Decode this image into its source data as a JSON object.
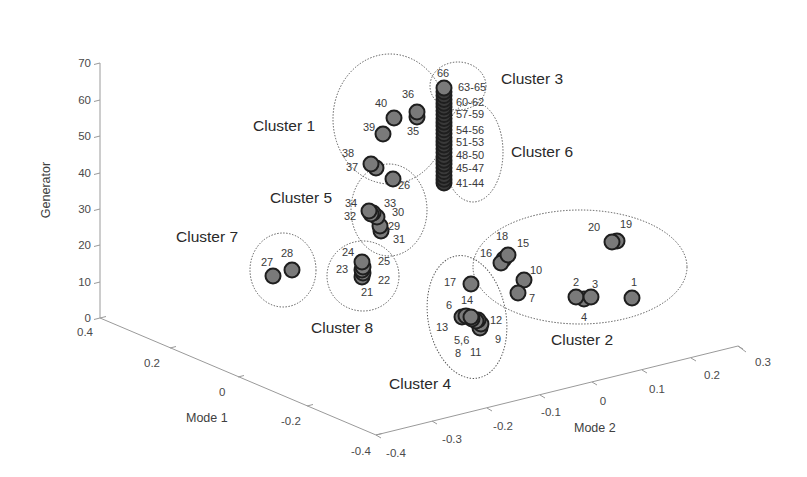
{
  "chart_data": {
    "type": "scatter",
    "subtype": "3d-scatter",
    "title": "",
    "xlabel": "Mode 1",
    "ylabel": "Mode 2",
    "zlabel": "Generator",
    "xlim": [
      -0.4,
      0.4
    ],
    "ylim": [
      -0.4,
      0.3
    ],
    "zlim": [
      0,
      70
    ],
    "x_ticks": [
      "0.4",
      "0.2",
      "0",
      "-0.2",
      "-0.4"
    ],
    "y_ticks": [
      "-0.4",
      "-0.3",
      "-0.2",
      "-0.1",
      "0",
      "0.1",
      "0.2",
      "0.3"
    ],
    "z_ticks": [
      "0",
      "10",
      "20",
      "30",
      "40",
      "50",
      "60",
      "70"
    ],
    "grid": false,
    "legend": null,
    "marker_color": "#7a7a7a",
    "marker_edge": "#1e1e1e",
    "clusters": [
      {
        "name": "Cluster 1",
        "generators": [
          35,
          36,
          37,
          38,
          39,
          40
        ]
      },
      {
        "name": "Cluster 2",
        "generators": [
          1,
          2,
          3,
          4,
          7,
          10,
          15,
          16,
          18,
          19,
          20
        ]
      },
      {
        "name": "Cluster 3",
        "generators": [
          63,
          64,
          65,
          66
        ]
      },
      {
        "name": "Cluster 4",
        "generators": [
          5,
          6,
          8,
          9,
          11,
          12,
          13,
          14,
          17
        ]
      },
      {
        "name": "Cluster 5",
        "generators": [
          26,
          29,
          30,
          31,
          32,
          33,
          34
        ]
      },
      {
        "name": "Cluster 6",
        "generators": [
          41,
          42,
          43,
          44,
          45,
          46,
          47,
          48,
          49,
          50,
          51,
          52,
          53,
          54,
          55,
          56,
          57,
          58,
          59,
          60,
          61,
          62
        ]
      },
      {
        "name": "Cluster 7",
        "generators": [
          27,
          28
        ]
      },
      {
        "name": "Cluster 8",
        "generators": [
          21,
          22,
          23,
          24,
          25
        ]
      }
    ],
    "point_labels": [
      "1",
      "2",
      "3",
      "4",
      "5,6",
      "6",
      "7",
      "8",
      "9",
      "10",
      "11",
      "12",
      "13",
      "14",
      "15",
      "16",
      "17",
      "18",
      "19",
      "20",
      "21",
      "22",
      "23",
      "24",
      "25",
      "26",
      "27",
      "28",
      "29",
      "30",
      "31",
      "32",
      "33",
      "34",
      "35",
      "36",
      "37",
      "38",
      "39",
      "40",
      "41-44",
      "45-47",
      "48-50",
      "51-53",
      "54-56",
      "57-59",
      "60-62",
      "63-65",
      "66"
    ]
  },
  "axes": {
    "z": {
      "label": "Generator",
      "ticks": [
        {
          "label": "70",
          "x": 100,
          "y": 63
        },
        {
          "label": "60",
          "x": 100,
          "y": 100
        },
        {
          "label": "50",
          "x": 100,
          "y": 136
        },
        {
          "label": "40",
          "x": 100,
          "y": 173
        },
        {
          "label": "30",
          "x": 100,
          "y": 209
        },
        {
          "label": "20",
          "x": 100,
          "y": 245
        },
        {
          "label": "10",
          "x": 100,
          "y": 282
        },
        {
          "label": "0",
          "x": 100,
          "y": 318
        }
      ]
    },
    "mode1": {
      "label": "Mode 1",
      "ticks": [
        {
          "label": "0.4",
          "x": 100,
          "y": 318,
          "lx": 77,
          "ly": 336
        },
        {
          "label": "0.2",
          "x": 170,
          "y": 348,
          "lx": 144,
          "ly": 367
        },
        {
          "label": "0",
          "x": 238,
          "y": 377,
          "lx": 219,
          "ly": 396
        },
        {
          "label": "-0.2",
          "x": 307,
          "y": 406,
          "lx": 281,
          "ly": 425
        },
        {
          "label": "-0.4",
          "x": 376,
          "y": 435,
          "lx": 351,
          "ly": 455
        }
      ]
    },
    "mode2": {
      "label": "Mode 2",
      "ticks": [
        {
          "label": "-0.4",
          "x": 376,
          "y": 435,
          "lx": 396,
          "ly": 457
        },
        {
          "label": "-0.3",
          "x": 432,
          "y": 421,
          "lx": 452,
          "ly": 443
        },
        {
          "label": "-0.2",
          "x": 487,
          "y": 408,
          "lx": 503,
          "ly": 430
        },
        {
          "label": "-0.1",
          "x": 540,
          "y": 395,
          "lx": 551,
          "ly": 416
        },
        {
          "label": "0",
          "x": 592,
          "y": 382,
          "lx": 603,
          "ly": 405
        },
        {
          "label": "0.1",
          "x": 642,
          "y": 370,
          "lx": 657,
          "ly": 393
        },
        {
          "label": "0.2",
          "x": 691,
          "y": 358,
          "lx": 712,
          "ly": 379
        },
        {
          "label": "0.3",
          "x": 738,
          "y": 346,
          "lx": 763,
          "ly": 366
        }
      ]
    }
  },
  "points": [
    {
      "id": "1",
      "x": 632,
      "y": 298
    },
    {
      "id": "4",
      "x": 584,
      "y": 299
    },
    {
      "id": "2",
      "x": 576,
      "y": 297
    },
    {
      "id": "3",
      "x": 591,
      "y": 297
    },
    {
      "id": "19",
      "x": 617,
      "y": 241
    },
    {
      "id": "20",
      "x": 612,
      "y": 242
    },
    {
      "id": "18",
      "x": 504,
      "y": 259
    },
    {
      "id": "16",
      "x": 501,
      "y": 263
    },
    {
      "id": "15",
      "x": 508,
      "y": 255
    },
    {
      "id": "10",
      "x": 524,
      "y": 280
    },
    {
      "id": "7",
      "x": 518,
      "y": 293
    },
    {
      "id": "17",
      "x": 471,
      "y": 284
    },
    {
      "id": "11",
      "x": 480,
      "y": 328
    },
    {
      "id": "9",
      "x": 481,
      "y": 324
    },
    {
      "id": "12",
      "x": 478,
      "y": 320
    },
    {
      "id": "8",
      "x": 476,
      "y": 321
    },
    {
      "id": "5,6",
      "x": 472,
      "y": 319
    },
    {
      "id": "13",
      "x": 462,
      "y": 317
    },
    {
      "id": "6",
      "x": 466,
      "y": 316
    },
    {
      "id": "14",
      "x": 471,
      "y": 317
    },
    {
      "id": "27",
      "x": 273,
      "y": 276
    },
    {
      "id": "28",
      "x": 292,
      "y": 270
    },
    {
      "id": "21",
      "x": 362,
      "y": 277
    },
    {
      "id": "22",
      "x": 363,
      "y": 273
    },
    {
      "id": "23",
      "x": 362,
      "y": 270
    },
    {
      "id": "25",
      "x": 363,
      "y": 267
    },
    {
      "id": "24",
      "x": 362,
      "y": 262
    },
    {
      "id": "31",
      "x": 381,
      "y": 231
    },
    {
      "id": "29",
      "x": 380,
      "y": 226
    },
    {
      "id": "30",
      "x": 377,
      "y": 217
    },
    {
      "id": "33",
      "x": 373,
      "y": 213
    },
    {
      "id": "32",
      "x": 371,
      "y": 214
    },
    {
      "id": "34",
      "x": 369,
      "y": 211
    },
    {
      "id": "26",
      "x": 393,
      "y": 179
    },
    {
      "id": "37",
      "x": 376,
      "y": 168
    },
    {
      "id": "38",
      "x": 371,
      "y": 164
    },
    {
      "id": "39",
      "x": 383,
      "y": 134
    },
    {
      "id": "40",
      "x": 394,
      "y": 118
    },
    {
      "id": "35",
      "x": 417,
      "y": 117
    },
    {
      "id": "36",
      "x": 417,
      "y": 112
    }
  ],
  "column": {
    "x": 444,
    "y_top": 88,
    "y_bottom": 183,
    "count": 26,
    "top_id": "66"
  },
  "labels": [
    {
      "text": "66",
      "x": 437,
      "y": 77
    },
    {
      "text": "63-65",
      "x": 458,
      "y": 91
    },
    {
      "text": "60-62",
      "x": 456,
      "y": 106
    },
    {
      "text": "57-59",
      "x": 456,
      "y": 118
    },
    {
      "text": "54-56",
      "x": 456,
      "y": 134
    },
    {
      "text": "51-53",
      "x": 456,
      "y": 146
    },
    {
      "text": "48-50",
      "x": 456,
      "y": 159
    },
    {
      "text": "45-47",
      "x": 456,
      "y": 172
    },
    {
      "text": "41-44",
      "x": 456,
      "y": 187
    },
    {
      "text": "36",
      "x": 402,
      "y": 98
    },
    {
      "text": "40",
      "x": 375,
      "y": 107
    },
    {
      "text": "39",
      "x": 363,
      "y": 131
    },
    {
      "text": "35",
      "x": 407,
      "y": 135
    },
    {
      "text": "38",
      "x": 342,
      "y": 157
    },
    {
      "text": "37",
      "x": 346,
      "y": 171
    },
    {
      "text": "26",
      "x": 398,
      "y": 189
    },
    {
      "text": "34",
      "x": 345,
      "y": 207
    },
    {
      "text": "33",
      "x": 384,
      "y": 207
    },
    {
      "text": "30",
      "x": 392,
      "y": 216
    },
    {
      "text": "32",
      "x": 344,
      "y": 220
    },
    {
      "text": "29",
      "x": 388,
      "y": 230
    },
    {
      "text": "31",
      "x": 393,
      "y": 243
    },
    {
      "text": "28",
      "x": 281,
      "y": 257
    },
    {
      "text": "27",
      "x": 261,
      "y": 266
    },
    {
      "text": "24",
      "x": 342,
      "y": 256
    },
    {
      "text": "25",
      "x": 378,
      "y": 265
    },
    {
      "text": "23",
      "x": 336,
      "y": 273
    },
    {
      "text": "22",
      "x": 378,
      "y": 284
    },
    {
      "text": "21",
      "x": 361,
      "y": 296
    },
    {
      "text": "18",
      "x": 496,
      "y": 240
    },
    {
      "text": "15",
      "x": 517,
      "y": 247
    },
    {
      "text": "16",
      "x": 480,
      "y": 257
    },
    {
      "text": "10",
      "x": 530,
      "y": 274
    },
    {
      "text": "7",
      "x": 529,
      "y": 302
    },
    {
      "text": "17",
      "x": 444,
      "y": 286
    },
    {
      "text": "6",
      "x": 446,
      "y": 309
    },
    {
      "text": "14",
      "x": 461,
      "y": 304
    },
    {
      "text": "12",
      "x": 490,
      "y": 324
    },
    {
      "text": "13",
      "x": 436,
      "y": 331
    },
    {
      "text": "5,6",
      "x": 454,
      "y": 344
    },
    {
      "text": "9",
      "x": 495,
      "y": 343
    },
    {
      "text": "8",
      "x": 455,
      "y": 357
    },
    {
      "text": "11",
      "x": 470,
      "y": 356
    },
    {
      "text": "20",
      "x": 588,
      "y": 231
    },
    {
      "text": "19",
      "x": 620,
      "y": 228
    },
    {
      "text": "2",
      "x": 573,
      "y": 286
    },
    {
      "text": "3",
      "x": 592,
      "y": 288
    },
    {
      "text": "1",
      "x": 631,
      "y": 286
    },
    {
      "text": "4",
      "x": 581,
      "y": 321
    }
  ],
  "cluster_labels": [
    {
      "text": "Cluster 1",
      "x": 253,
      "y": 131
    },
    {
      "text": "Cluster 2",
      "x": 551,
      "y": 345
    },
    {
      "text": "Cluster 3",
      "x": 501,
      "y": 84
    },
    {
      "text": "Cluster 4",
      "x": 389,
      "y": 389
    },
    {
      "text": "Cluster 5",
      "x": 270,
      "y": 203
    },
    {
      "text": "Cluster 6",
      "x": 511,
      "y": 157
    },
    {
      "text": "Cluster 7",
      "x": 176,
      "y": 242
    },
    {
      "text": "Cluster 8",
      "x": 311,
      "y": 333
    }
  ],
  "outlines": [
    {
      "name": "cluster-1-outline",
      "cx": 390,
      "cy": 119,
      "rx": 57,
      "ry": 65,
      "rot": 0
    },
    {
      "name": "cluster-3-outline",
      "cx": 458,
      "cy": 86,
      "rx": 28,
      "ry": 24,
      "rot": 0
    },
    {
      "name": "cluster-6-outline",
      "cx": 473,
      "cy": 152,
      "rx": 30,
      "ry": 50,
      "rot": 0
    },
    {
      "name": "cluster-5-outline",
      "cx": 389,
      "cy": 210,
      "rx": 38,
      "ry": 46,
      "rot": 0
    },
    {
      "name": "cluster-7-outline",
      "cx": 283,
      "cy": 270,
      "rx": 33,
      "ry": 37,
      "rot": 0
    },
    {
      "name": "cluster-8-outline",
      "cx": 363,
      "cy": 276,
      "rx": 36,
      "ry": 35,
      "rot": 0
    },
    {
      "name": "cluster-4-outline",
      "cx": 467,
      "cy": 317,
      "rx": 39,
      "ry": 62,
      "rot": -10
    },
    {
      "name": "cluster-2-outline",
      "cx": 580,
      "cy": 267,
      "rx": 107,
      "ry": 57,
      "rot": 0
    }
  ]
}
